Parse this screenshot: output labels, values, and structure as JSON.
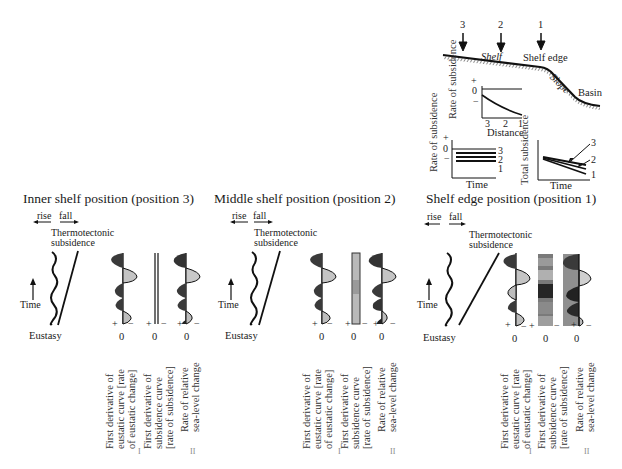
{
  "top_schematic": {
    "position_markers": [
      "3",
      "2",
      "1"
    ],
    "labels": {
      "shelf": "Shelf",
      "shelf_edge": "Shelf edge",
      "slope": "Slope",
      "basin": "Basin"
    }
  },
  "inset_rate_vs_distance": {
    "ylabel": "Rate of subsidence",
    "y_ticks": [
      "+",
      "0",
      "−"
    ],
    "x_ticks": [
      "3",
      "2",
      "1"
    ],
    "xlabel": "Distance"
  },
  "inset_rate_vs_time": {
    "ylabel": "Rate of subsidence",
    "y_ticks": [
      "+",
      "0",
      "−"
    ],
    "line_labels": [
      "3",
      "2",
      "1"
    ],
    "xlabel": "Time"
  },
  "inset_total_vs_time": {
    "ylabel": "Total subsidence",
    "line_labels": [
      "3",
      "2",
      "1"
    ],
    "xlabel": "Time"
  },
  "panels": [
    {
      "title": "Inner shelf position (position 3)",
      "rise": "rise",
      "fall": "fall",
      "subsidence_label_1": "Thermotectonic",
      "subsidence_label_2": "subsidence",
      "time": "Time",
      "eustasy": "Eustasy",
      "zero": "0",
      "plus": "+",
      "minus": "−",
      "col1_label": [
        "First derivative of",
        "eustatic curve [rate",
        "of eustatic change]"
      ],
      "col2_label": [
        "First derivative of",
        "subsidence curve",
        "[rate of subsidence]"
      ],
      "col3_label": [
        "Rate of relative",
        "sea-level change"
      ],
      "roman1": "I",
      "roman2": "II"
    },
    {
      "title": "Middle shelf position (position 2)",
      "rise": "rise",
      "fall": "fall",
      "subsidence_label_1": "Thermotectonic",
      "subsidence_label_2": "subsidence",
      "time": "Time",
      "eustasy": "Eustasy",
      "zero": "0",
      "plus": "+",
      "minus": "−",
      "col1_label": [
        "First derivative of",
        "eustatic curve [rate",
        "of eustatic change]"
      ],
      "col2_label": [
        "First derivative of",
        "subsidence curve",
        "[rate of subsidence]"
      ],
      "col3_label": [
        "Rate of relative",
        "sea-level change"
      ],
      "roman1": "I",
      "roman2": "II"
    },
    {
      "title": "Shelf edge position (position 1)",
      "rise": "rise",
      "fall": "fall",
      "subsidence_label_1": "Thermotectonic",
      "subsidence_label_2": "subsidence",
      "time": "Time",
      "eustasy": "Eustasy",
      "zero": "0",
      "plus": "+",
      "minus": "−",
      "col1_label": [
        "First derivative of",
        "eustatic curve [rate",
        "of eustatic change]"
      ],
      "col2_label": [
        "First derivative of",
        "subsidence curve",
        "[rate of subsidence]"
      ],
      "col3_label": [
        "Rate of relative",
        "sea-level change"
      ],
      "roman1": "I",
      "roman2": "II"
    }
  ],
  "colors": {
    "ink": "#1a1a1a",
    "dark_fill": "#3a3a3a",
    "light_fill": "#bdbdbd"
  }
}
